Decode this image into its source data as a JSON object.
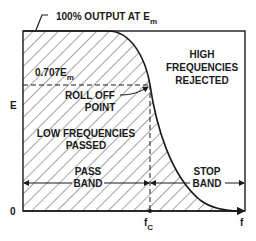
{
  "diagram": {
    "colors": {
      "ink": "#1a1a1a",
      "background": "#ffffff"
    },
    "annotations": {
      "top_label": "100% OUTPUT AT E",
      "top_label_sub": "m",
      "level_label": "0.707E",
      "level_label_sub": "m",
      "rolloff_line1": "ROLL OFF",
      "rolloff_line2": "POINT",
      "low_line1": "LOW FREQUENCIES",
      "low_line2": "PASSED",
      "high_line1": "HIGH",
      "high_line2": "FREQUENCIES",
      "high_line3": "REJECTED",
      "pass_line1": "PASS",
      "pass_line2": "BAND",
      "stop_line1": "STOP",
      "stop_line2": "BAND"
    },
    "axes": {
      "y_label": "E",
      "origin_label": "0",
      "x_label": "f",
      "cutoff_label": "f",
      "cutoff_sub": "C"
    }
  }
}
